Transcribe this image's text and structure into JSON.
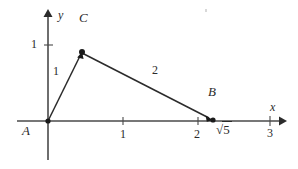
{
  "figure": {
    "background": "#ffffff",
    "stroke_color": "#4a4a4a",
    "text_color": "#2b2b2b",
    "width": 298,
    "height": 169
  },
  "axes": {
    "x_axis": {
      "label": "x",
      "origin_px": {
        "x": 48,
        "y": 121
      },
      "start_px": {
        "x": 17,
        "y": 121
      },
      "end_px": {
        "x": 282,
        "y": 121
      },
      "tick_labels": [
        "1",
        "2",
        "3"
      ],
      "tick_positions_px": [
        123,
        198,
        270
      ]
    },
    "y_axis": {
      "label": "y",
      "start_px": {
        "x": 48,
        "y": 160
      },
      "end_px": {
        "x": 48,
        "y": 10
      },
      "tick_labels": [
        "1"
      ],
      "tick_positions_px": [
        45
      ]
    }
  },
  "points": [
    {
      "name": "A",
      "label": "A",
      "x_px": 48,
      "y_px": 121,
      "dot": false,
      "label_x": 22,
      "label_y": 124
    },
    {
      "name": "B",
      "label": "B",
      "x_px": 213,
      "y_px": 120,
      "dot": true,
      "label_x": 208,
      "label_y": 85
    },
    {
      "name": "C",
      "label": "C",
      "x_px": 82,
      "y_px": 52,
      "dot": true,
      "label_x": 79,
      "label_y": 11
    }
  ],
  "segments": [
    {
      "name": "AC",
      "from": "A",
      "to": "C",
      "length_label": "1",
      "label_x": 53,
      "label_y": 65,
      "arrow": true
    },
    {
      "name": "CB",
      "from": "C",
      "to": "B",
      "length_label": "2",
      "label_x": 152,
      "label_y": 64,
      "arrow": true
    }
  ],
  "annotations": {
    "sqrt_value": "5",
    "sqrt_label_x": 218,
    "sqrt_label_y": 122
  }
}
